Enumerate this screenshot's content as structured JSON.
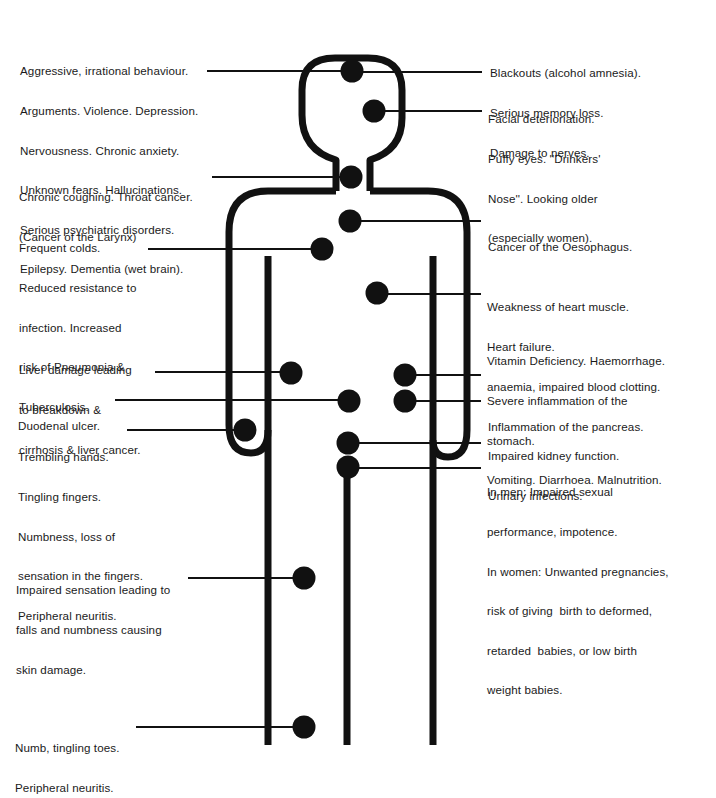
{
  "diagram": {
    "colors": {
      "ink": "#111111",
      "background": "#ffffff"
    }
  },
  "labels": {
    "left": [
      {
        "id": "brain-behaviour",
        "lines": [
          "Aggressive, irrational behaviour.",
          "Arguments. Violence. Depression.",
          "Nervousness. Chronic anxiety.",
          "Unknown fears. Hallucinations.",
          "Serious psychiatric disorders.",
          "Epilepsy. Dementia (wet brain)."
        ]
      },
      {
        "id": "throat",
        "lines": [
          "Chronic coughing. Throat cancer.",
          "(Cancer of the Larynx)"
        ]
      },
      {
        "id": "lungs",
        "lines": [
          "Frequent colds.",
          "Reduced resistance to",
          "infection. Increased",
          "risk of Pneumonia &",
          "Tuberculosis."
        ]
      },
      {
        "id": "liver",
        "lines": [
          "Liver damage leading",
          "to breakdown &",
          "cirrhosis & liver cancer."
        ]
      },
      {
        "id": "duodenum",
        "lines": [
          "Duodenal ulcer."
        ]
      },
      {
        "id": "hands",
        "lines": [
          "Trembling hands.",
          "Tingling fingers.",
          "Numbness, loss of",
          "sensation in the fingers.",
          "Peripheral neuritis."
        ]
      },
      {
        "id": "legs",
        "lines": [
          "Impaired sensation leading to",
          "falls and numbness causing",
          "skin damage."
        ]
      },
      {
        "id": "toes",
        "lines": [
          "Numb, tingling toes.",
          "Peripheral neuritis."
        ]
      }
    ],
    "right": [
      {
        "id": "brain-memory",
        "lines": [
          "Blackouts (alcohol amnesia).",
          "Serious memory loss.",
          "Damage to nerves."
        ]
      },
      {
        "id": "face",
        "lines": [
          "Facial deterioriation.",
          "Puffy eyes. ''Drinkers'",
          "Nose''. Looking older",
          "(especially women)."
        ]
      },
      {
        "id": "oesophagus",
        "lines": [
          "Cancer of the Oesophagus."
        ]
      },
      {
        "id": "heart",
        "lines": [
          "Weakness of heart muscle.",
          "Heart failure.",
          "anaemia, impaired blood clotting."
        ]
      },
      {
        "id": "stomach",
        "lines": [
          "Vitamin Deficiency. Haemorrhage.",
          "Severe inflammation of the",
          "stomach.",
          "Vomiting. Diarrhoea. Malnutrition."
        ]
      },
      {
        "id": "pancreas",
        "lines": [
          "Inflammation of the pancreas."
        ]
      },
      {
        "id": "kidney",
        "lines": [
          "Impaired kidney function.",
          "Urinary infections."
        ]
      },
      {
        "id": "sexual",
        "lines": [
          "In men: Impaired sexual",
          "performance, impotence.",
          "In women: Unwanted pregnancies,",
          "risk of giving  birth to deformed,",
          "retarded  babies, or low birth",
          "weight babies."
        ]
      }
    ]
  }
}
